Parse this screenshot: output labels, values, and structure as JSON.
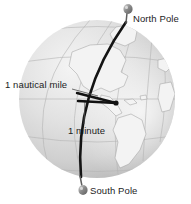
{
  "figure": {
    "background_color": "#ffffff",
    "globe": {
      "fill_light": "#e9e9e9",
      "fill_mid": "#d2d2d2",
      "fill_shadow": "#b4b4b4",
      "graticule_color": "#b0b0b0",
      "landmass_color": "#f2f2f2",
      "landmass_outline": "#9a9a9a",
      "center_x": 97,
      "center_y": 99,
      "radius_x": 78,
      "radius_y": 79
    },
    "meridian": {
      "name": "highlighted-meridian",
      "color": "#141414",
      "width": 2.6
    },
    "angle": {
      "name": "one-minute-angle",
      "color": "#111111",
      "vertex_x": 116,
      "vertex_y": 103,
      "arm_width": 2.4
    },
    "leader_line_color": "#4a4a4a",
    "pin_color": "#6e6e6e",
    "pin_highlight": "#cfcfcf"
  },
  "labels": {
    "north_pole": "North Pole",
    "south_pole": "South Pole",
    "nautical_mile": "1 nautical mile",
    "minute": "1 minute"
  },
  "icons": {
    "north_pin": "map-pin-icon",
    "south_pin": "map-pin-icon"
  }
}
